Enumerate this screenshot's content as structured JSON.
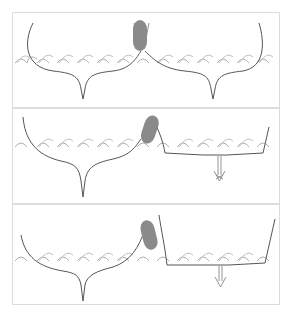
{
  "diagram": {
    "type": "three-panel illustration",
    "colors": {
      "hull_line": "#555555",
      "wave_line": "#b0b0b0",
      "fender": "#8a8a8a",
      "panel_border": "#dcdcdc",
      "arrow": "#7a7a7a"
    },
    "panels": [
      {
        "id": 1,
        "description": "Two fin-keel hulls side by side on waves with a fender (grey capsule) between them",
        "elements": [
          "left-hull",
          "right-hull",
          "fender",
          "waves"
        ]
      },
      {
        "id": 2,
        "description": "Left hull intact; right hull cut open and sinking, fender squeezed upward, downward arrow under the right hull",
        "elements": [
          "left-hull",
          "broken-right-hull",
          "fender",
          "sink-arrow",
          "waves"
        ]
      },
      {
        "id": 3,
        "description": "Left hull tilts; fender pushed higher; right hull continues sinking with downward arrow",
        "elements": [
          "left-hull",
          "broken-right-hull",
          "fender",
          "sink-arrow",
          "waves"
        ]
      }
    ]
  }
}
